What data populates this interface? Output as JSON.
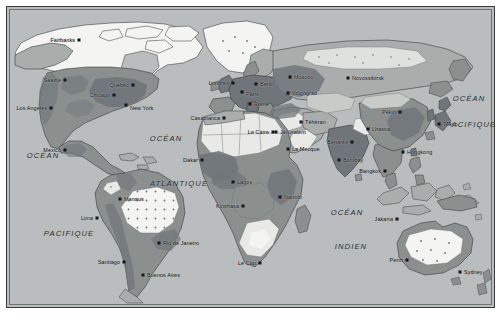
{
  "map": {
    "title": "Carte du monde",
    "projection": "Rectangulaire (Plate carrée)",
    "language": "fr",
    "frame": {
      "border_color": "#3a3a3a",
      "paper_color": "#ffffff"
    },
    "palette": {
      "ocean": "#b9bdbd",
      "land_light": "#e9eae8",
      "land_mid": "#a9aeac",
      "land_dark": "#8b908e",
      "land_darkest": "#70757a",
      "ice": "#f4f5f3",
      "border_line": "#5d6265",
      "coast_line": "#2f3235",
      "dot_color": "#15161a",
      "text_color": "#101114"
    },
    "ocean_labels": [
      {
        "name": "ocean-pacifique-est-haut",
        "line1": "OCÉAN",
        "line2": "PACIFIQUE",
        "x1": 36,
        "y1": 148,
        "x2": 62,
        "y2": 226
      },
      {
        "name": "ocean-atlantique",
        "line1": "OCÉAN",
        "line2": "ATLANTIQUE",
        "x1": 159,
        "y1": 131,
        "x2": 172,
        "y2": 176
      },
      {
        "name": "ocean-indien",
        "line1": "OCÉAN",
        "line2": "INDIEN",
        "x1": 340,
        "y1": 205,
        "x2": 344,
        "y2": 239
      },
      {
        "name": "ocean-pacifique-ouest",
        "line1": "OCÉAN",
        "line2": "PACIFIQUE",
        "x1": 462,
        "y1": 91,
        "x2": 464,
        "y2": 117
      }
    ],
    "cities": [
      {
        "name": "fairbanks",
        "label": "Fairbanks",
        "x": 72,
        "y": 33,
        "align": "r",
        "dx": -4,
        "dy": 0
      },
      {
        "name": "seattle",
        "label": "Seattle",
        "x": 58,
        "y": 73,
        "align": "r",
        "dx": -4,
        "dy": 0
      },
      {
        "name": "los-angeles",
        "label": "Los Angeles",
        "x": 44,
        "y": 101,
        "align": "r",
        "dx": -4,
        "dy": 0
      },
      {
        "name": "chicago",
        "label": "Chicago",
        "x": 107,
        "y": 88,
        "align": "r",
        "dx": -4,
        "dy": 0
      },
      {
        "name": "quebec",
        "label": "Québec",
        "x": 126,
        "y": 78,
        "align": "r",
        "dx": -4,
        "dy": -0.5
      },
      {
        "name": "new-york",
        "label": "New York",
        "x": 119,
        "y": 98,
        "align": "l",
        "dx": 4,
        "dy": 2.5
      },
      {
        "name": "mexico",
        "label": "Mexico",
        "x": 58,
        "y": 143,
        "align": "r",
        "dx": -4,
        "dy": 0
      },
      {
        "name": "manaus",
        "label": "Manaus",
        "x": 113,
        "y": 192,
        "align": "l",
        "dx": 4,
        "dy": 0
      },
      {
        "name": "lima",
        "label": "Lima",
        "x": 90,
        "y": 211,
        "align": "r",
        "dx": -4,
        "dy": 0
      },
      {
        "name": "rio-de-janeiro",
        "label": "Rio de Janeiro",
        "x": 152,
        "y": 236,
        "align": "l",
        "dx": 4,
        "dy": 0
      },
      {
        "name": "santiago",
        "label": "Santiago",
        "x": 117,
        "y": 255,
        "align": "r",
        "dx": -4,
        "dy": 0
      },
      {
        "name": "buenos-aires",
        "label": "Buenos Aires",
        "x": 136,
        "y": 268,
        "align": "l",
        "dx": 4,
        "dy": 0
      },
      {
        "name": "londres",
        "label": "Londres",
        "x": 226,
        "y": 76,
        "align": "r",
        "dx": -4,
        "dy": 0
      },
      {
        "name": "paris",
        "label": "Paris",
        "x": 235,
        "y": 85,
        "align": "l",
        "dx": 4,
        "dy": 1.5
      },
      {
        "name": "berlin",
        "label": "Berlin",
        "x": 249,
        "y": 77,
        "align": "l",
        "dx": 4,
        "dy": 0
      },
      {
        "name": "rome",
        "label": "Rome",
        "x": 243,
        "y": 97,
        "align": "l",
        "dx": 4,
        "dy": 0
      },
      {
        "name": "moscou",
        "label": "Moscou",
        "x": 283,
        "y": 70,
        "align": "l",
        "dx": 4,
        "dy": 0
      },
      {
        "name": "volgograd",
        "label": "Volgograd",
        "x": 281,
        "y": 86,
        "align": "l",
        "dx": 4,
        "dy": 0
      },
      {
        "name": "novossibirsk",
        "label": "Novossibirsk",
        "x": 341,
        "y": 71,
        "align": "l",
        "dx": 4,
        "dy": 0
      },
      {
        "name": "pekin",
        "label": "Pékin",
        "x": 393,
        "y": 105,
        "align": "r",
        "dx": -4,
        "dy": 0
      },
      {
        "name": "tokyo",
        "label": "Tokyo",
        "x": 432,
        "y": 117,
        "align": "l",
        "dx": 4,
        "dy": 0
      },
      {
        "name": "casablanca",
        "label": "Casablanca",
        "x": 217,
        "y": 111,
        "align": "r",
        "dx": -4,
        "dy": 0
      },
      {
        "name": "le-caire",
        "label": "Le Caire",
        "x": 266,
        "y": 125,
        "align": "r",
        "dx": -4,
        "dy": 0
      },
      {
        "name": "jerusalem",
        "label": "Jérusalem",
        "x": 269,
        "y": 125,
        "align": "l",
        "dx": 4,
        "dy": 0
      },
      {
        "name": "la-mecque",
        "label": "La Mecque",
        "x": 281,
        "y": 142,
        "align": "l",
        "dx": 4,
        "dy": 0
      },
      {
        "name": "teheran",
        "label": "Téhéran",
        "x": 294,
        "y": 115,
        "align": "l",
        "dx": 4,
        "dy": 0
      },
      {
        "name": "lhassa",
        "label": "Lhassa",
        "x": 361,
        "y": 122,
        "align": "l",
        "dx": 4,
        "dy": 0
      },
      {
        "name": "benares",
        "label": "Bénarès",
        "x": 345,
        "y": 135,
        "align": "r",
        "dx": -4,
        "dy": 0
      },
      {
        "name": "bombay",
        "label": "Bombay",
        "x": 332,
        "y": 153,
        "align": "l",
        "dx": 4,
        "dy": 0
      },
      {
        "name": "bangkok",
        "label": "Bangkok",
        "x": 378,
        "y": 164,
        "align": "r",
        "dx": -4,
        "dy": 0
      },
      {
        "name": "hongkong",
        "label": "Hongkong",
        "x": 396,
        "y": 145,
        "align": "l",
        "dx": 4,
        "dy": 0
      },
      {
        "name": "jakarta",
        "label": "Jakarta",
        "x": 390,
        "y": 212,
        "align": "r",
        "dx": -4,
        "dy": 0
      },
      {
        "name": "dakar",
        "label": "Dakar",
        "x": 195,
        "y": 153,
        "align": "r",
        "dx": -4,
        "dy": 0
      },
      {
        "name": "lagos",
        "label": "Lagos",
        "x": 226,
        "y": 175,
        "align": "l",
        "dx": 4,
        "dy": 0
      },
      {
        "name": "kinshasa",
        "label": "Kinshasa",
        "x": 236,
        "y": 199,
        "align": "r",
        "dx": -4,
        "dy": 0
      },
      {
        "name": "nairobi",
        "label": "Nairobi",
        "x": 273,
        "y": 190,
        "align": "l",
        "dx": 4,
        "dy": 0
      },
      {
        "name": "le-cap",
        "label": "Le Cap",
        "x": 253,
        "y": 256,
        "align": "r",
        "dx": -4,
        "dy": 0
      },
      {
        "name": "perth",
        "label": "Perth",
        "x": 400,
        "y": 253,
        "align": "r",
        "dx": -4,
        "dy": 0
      },
      {
        "name": "sydney",
        "label": "Sydney",
        "x": 453,
        "y": 265,
        "align": "l",
        "dx": 4,
        "dy": 0
      }
    ]
  }
}
